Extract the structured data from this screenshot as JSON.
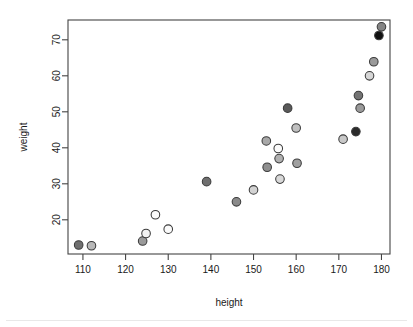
{
  "figure": {
    "background": "#ffffff",
    "frame_color": "#444444",
    "point_stroke": "#3a3a3a"
  },
  "axes": {
    "x_label": "height",
    "y_label": "weight",
    "x_ticks": [
      "110",
      "120",
      "130",
      "140",
      "150",
      "160",
      "170",
      "180"
    ],
    "y_ticks": [
      "20",
      "30",
      "40",
      "50",
      "60",
      "70"
    ]
  },
  "chart_data": {
    "type": "scatter",
    "title": "",
    "xlabel": "height",
    "ylabel": "weight",
    "xlim": [
      106.5,
      182.0
    ],
    "ylim": [
      10.5,
      75.5
    ],
    "xticks": [
      110,
      120,
      130,
      140,
      150,
      160,
      170,
      180
    ],
    "yticks": [
      20,
      30,
      40,
      50,
      60,
      70
    ],
    "grid": false,
    "legend": "none",
    "marker": "filled-circle",
    "marker_radius_px": 4.3,
    "series": [
      {
        "name": "observations",
        "points": [
          {
            "x": 109.0,
            "y": 13.0,
            "fill": "#6f6f6f"
          },
          {
            "x": 112.0,
            "y": 12.8,
            "fill": "#b8b8b8"
          },
          {
            "x": 124.0,
            "y": 14.1,
            "fill": "#9a9a9a"
          },
          {
            "x": 124.8,
            "y": 16.2,
            "fill": "#f2f2f2"
          },
          {
            "x": 127.0,
            "y": 21.4,
            "fill": "#fbfbfb"
          },
          {
            "x": 130.0,
            "y": 17.4,
            "fill": "#fbfbfb"
          },
          {
            "x": 139.0,
            "y": 30.6,
            "fill": "#6f6f6f"
          },
          {
            "x": 146.0,
            "y": 25.0,
            "fill": "#8a8a8a"
          },
          {
            "x": 150.0,
            "y": 28.3,
            "fill": "#d2d2d2"
          },
          {
            "x": 153.0,
            "y": 41.9,
            "fill": "#a8a8a8"
          },
          {
            "x": 153.2,
            "y": 34.6,
            "fill": "#8f8f8f"
          },
          {
            "x": 155.8,
            "y": 39.8,
            "fill": "#fbfbfb"
          },
          {
            "x": 156.0,
            "y": 37.0,
            "fill": "#b0b0b0"
          },
          {
            "x": 156.2,
            "y": 31.3,
            "fill": "#d8d8d8"
          },
          {
            "x": 158.0,
            "y": 51.0,
            "fill": "#595959"
          },
          {
            "x": 160.0,
            "y": 45.5,
            "fill": "#c0c0c0"
          },
          {
            "x": 160.2,
            "y": 35.7,
            "fill": "#a0a0a0"
          },
          {
            "x": 171.0,
            "y": 42.4,
            "fill": "#c8c8c8"
          },
          {
            "x": 174.0,
            "y": 44.5,
            "fill": "#2b2b2b"
          },
          {
            "x": 175.0,
            "y": 51.0,
            "fill": "#9a9a9a"
          },
          {
            "x": 174.6,
            "y": 54.5,
            "fill": "#737373"
          },
          {
            "x": 177.2,
            "y": 60.0,
            "fill": "#d6d6d6"
          },
          {
            "x": 178.2,
            "y": 63.9,
            "fill": "#9a9a9a"
          },
          {
            "x": 179.4,
            "y": 71.2,
            "fill": "#111111"
          },
          {
            "x": 180.0,
            "y": 73.6,
            "fill": "#858585"
          }
        ]
      }
    ]
  }
}
